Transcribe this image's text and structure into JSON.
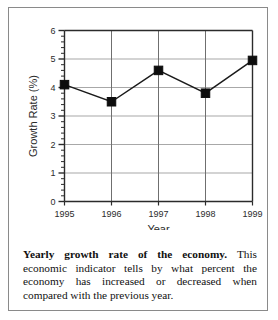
{
  "figure": {
    "caption_lead": "Yearly growth rate of the economy.",
    "caption_body": " This economic indicator tells by what percent the economy has increased or decreased when compared with the previous year."
  },
  "chart_data": {
    "type": "line",
    "title": "",
    "xlabel": "Year",
    "ylabel": "Growth Rate (%)",
    "categories": [
      "1995",
      "1996",
      "1997",
      "1998",
      "1999"
    ],
    "values": [
      4.1,
      3.5,
      4.6,
      3.8,
      4.95
    ],
    "ylim": [
      0,
      6
    ],
    "ytick_labels": [
      "0",
      "1",
      "2",
      "3",
      "4",
      "5",
      "6"
    ],
    "ytick_values": [
      0,
      1,
      2,
      3,
      4,
      5,
      6
    ],
    "minor_tick_step": 0.2,
    "grid": {
      "horizontal": true,
      "vertical": true
    },
    "legend": null,
    "colors": {
      "line": "#1a1a1a",
      "marker": "#0d0d0d",
      "axis": "#2b2b2b",
      "grid_horizontal": "#a8a8a8",
      "grid_vertical": "#6f6f6f",
      "text": "#2b2b2b",
      "frame": "#8a8a8a"
    }
  }
}
